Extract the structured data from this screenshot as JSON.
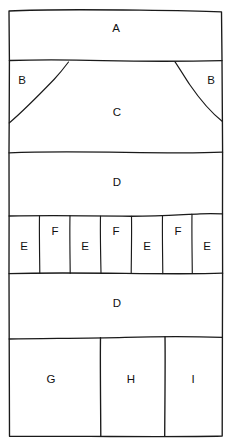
{
  "figure": {
    "kind": "hand-drawn-stratigraphic-section",
    "background_color": "#ffffff",
    "line_color": "#1a1a1a",
    "width": 230,
    "height": 446
  },
  "units": {
    "a": {
      "label": "A",
      "x": 116,
      "y": 29
    },
    "b_left": {
      "label": "B",
      "x": 22,
      "y": 81
    },
    "b_right": {
      "label": "B",
      "x": 211,
      "y": 81
    },
    "c": {
      "label": "C",
      "x": 117,
      "y": 113
    },
    "d_upper": {
      "label": "D",
      "x": 117,
      "y": 183
    },
    "d_lower": {
      "label": "D",
      "x": 117,
      "y": 304
    },
    "g": {
      "label": "G",
      "x": 51,
      "y": 380
    },
    "h": {
      "label": "H",
      "x": 131,
      "y": 380
    },
    "i": {
      "label": "I",
      "x": 193,
      "y": 380
    }
  },
  "band_e_f": {
    "name": "alternating-e-f-band",
    "cells": [
      {
        "label": "E",
        "x": 24,
        "y": 247
      },
      {
        "label": "F",
        "x": 55,
        "y": 232
      },
      {
        "label": "E",
        "x": 85,
        "y": 247
      },
      {
        "label": "F",
        "x": 116,
        "y": 232
      },
      {
        "label": "E",
        "x": 147,
        "y": 247
      },
      {
        "label": "F",
        "x": 178,
        "y": 232
      },
      {
        "label": "E",
        "x": 207,
        "y": 247
      }
    ]
  }
}
